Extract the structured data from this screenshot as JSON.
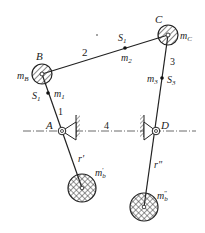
{
  "diagram": {
    "type": "four-bar linkage with counterweight balancing",
    "joints": {
      "B": {
        "label": "B",
        "mass_label": "m",
        "mass_sub": "B"
      },
      "C": {
        "label": "C",
        "mass_label": "m",
        "mass_sub": "C"
      },
      "A": {
        "label": "A"
      },
      "D": {
        "label": "D"
      }
    },
    "links": {
      "link1": {
        "label": "1",
        "com_label": "S",
        "com_sub": "1",
        "mass_label": "m",
        "mass_sub": "1"
      },
      "link2": {
        "label": "2",
        "com_label": "S",
        "com_sub": "1",
        "mass_label": "m",
        "mass_sub": "2"
      },
      "link3": {
        "label": "3",
        "com_label": "S",
        "com_sub": "3",
        "mass_label": "m",
        "mass_sub": "3"
      },
      "frame": {
        "label": "4"
      }
    },
    "counterweights": {
      "left": {
        "radius_label": "r'",
        "mass_label": "m",
        "mass_sub": "b",
        "mass_sup": "'"
      },
      "right": {
        "radius_label": "r\"",
        "mass_label": "m",
        "mass_sub": "b",
        "mass_sup": "\""
      }
    },
    "colors": {
      "line": "#222222",
      "hatch": "#333333",
      "axis": "#444444"
    }
  }
}
